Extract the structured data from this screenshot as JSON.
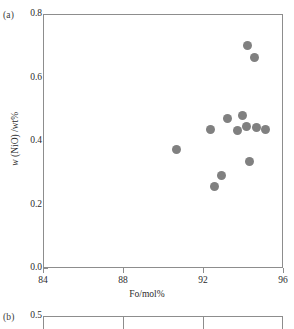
{
  "figure": {
    "panel_a_tag": "(a)",
    "panel_b_tag": "(b)"
  },
  "chart_data": {
    "type": "scatter",
    "title": "",
    "xlabel": "Fo/mol%",
    "ylabel": "w (NiO) /wt%",
    "ylabel_parts": {
      "italic": "w",
      "rest": " (NiO) /wt%"
    },
    "xlim": [
      84,
      96
    ],
    "ylim": [
      0.0,
      0.8
    ],
    "xticks": [
      "84",
      "88",
      "92",
      "96"
    ],
    "xtick_values": [
      84,
      88,
      92,
      96
    ],
    "yticks": [
      "0.0",
      "0.2",
      "0.4",
      "0.6",
      "0.8"
    ],
    "ytick_values": [
      0.0,
      0.2,
      0.4,
      0.6,
      0.8
    ],
    "grid": false,
    "legend": null,
    "marker": {
      "shape": "circle",
      "color": "#808080",
      "size_px": 9
    },
    "series": [
      {
        "name": "olivine",
        "points": [
          {
            "x": 90.6,
            "y": 0.375
          },
          {
            "x": 92.3,
            "y": 0.44
          },
          {
            "x": 92.5,
            "y": 0.26
          },
          {
            "x": 92.85,
            "y": 0.295
          },
          {
            "x": 93.15,
            "y": 0.475
          },
          {
            "x": 93.65,
            "y": 0.435
          },
          {
            "x": 93.9,
            "y": 0.485
          },
          {
            "x": 94.1,
            "y": 0.45
          },
          {
            "x": 94.15,
            "y": 0.705
          },
          {
            "x": 94.25,
            "y": 0.34
          },
          {
            "x": 94.5,
            "y": 0.665
          },
          {
            "x": 94.6,
            "y": 0.445
          },
          {
            "x": 95.05,
            "y": 0.44
          }
        ]
      }
    ]
  },
  "panel_b": {
    "ytop_label": "0.5",
    "xtick_values": [
      84,
      88,
      92,
      96
    ]
  }
}
